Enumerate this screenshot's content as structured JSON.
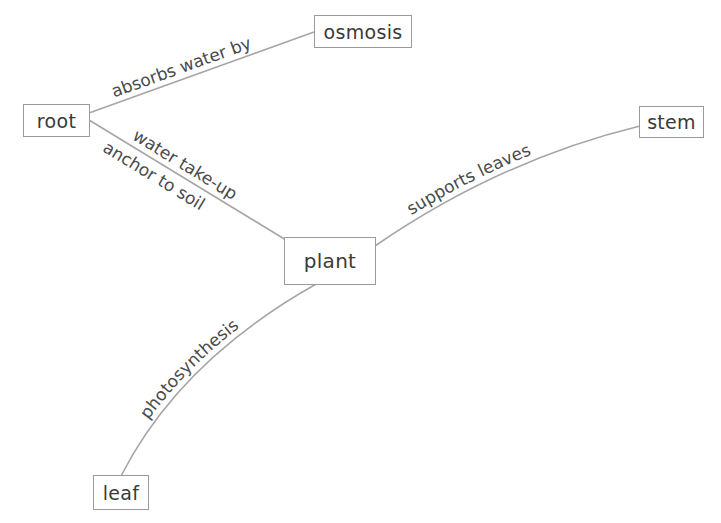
{
  "diagram": {
    "type": "concept-map",
    "nodes": [
      {
        "id": "root",
        "label": "root"
      },
      {
        "id": "osmosis",
        "label": "osmosis"
      },
      {
        "id": "plant",
        "label": "plant"
      },
      {
        "id": "stem",
        "label": "stem"
      },
      {
        "id": "leaf",
        "label": "leaf"
      }
    ],
    "edges": [
      {
        "from": "root",
        "to": "osmosis",
        "label": "absorbs water by"
      },
      {
        "from": "root",
        "to": "plant",
        "label_above": "water take-up",
        "label_below": "anchor to soil"
      },
      {
        "from": "plant",
        "to": "stem",
        "label": "supports leaves"
      },
      {
        "from": "plant",
        "to": "leaf",
        "label": "photosynthesis"
      }
    ],
    "colors": {
      "line": "#a6a6a6",
      "box_border": "#9a9a9a",
      "text": "#3a3a3a"
    }
  }
}
